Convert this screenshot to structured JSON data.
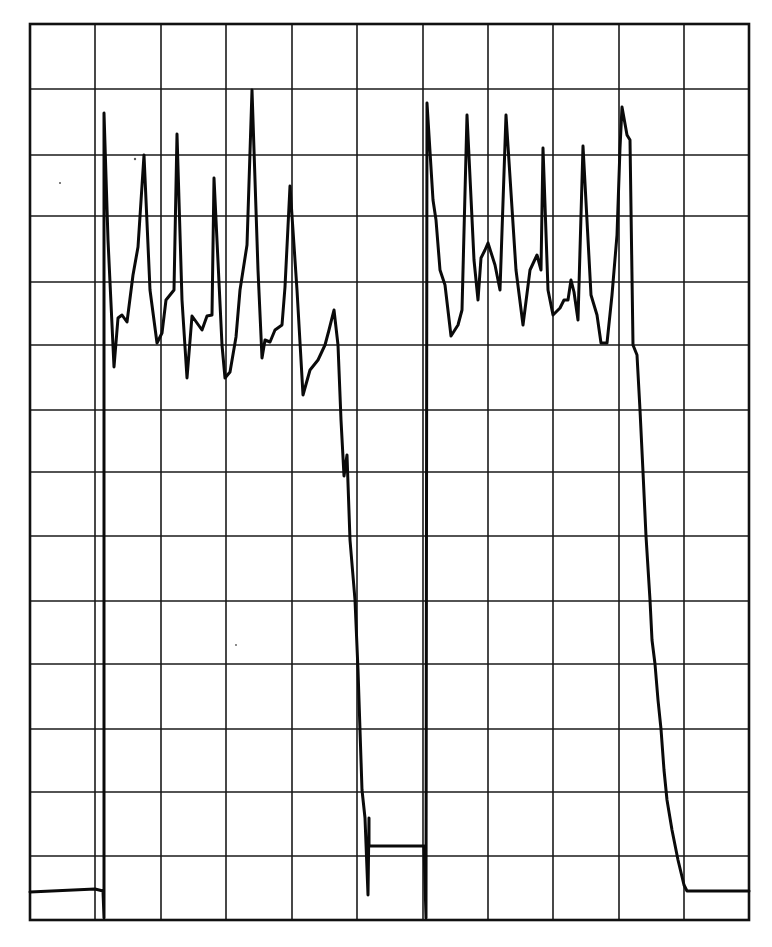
{
  "chart_data": {
    "type": "line",
    "title": "",
    "xlabel": "",
    "ylabel": "",
    "grid": true,
    "legend": null,
    "x_divisions": 11,
    "y_divisions": 14,
    "xlim": [
      0,
      11
    ],
    "ylim": [
      0,
      14
    ],
    "series": [
      {
        "name": "trace",
        "x": [
          0.0,
          1.0,
          1.13,
          1.15,
          1.2,
          1.33,
          1.41,
          1.49,
          1.63,
          1.72,
          1.83,
          1.92,
          2.05,
          2.18,
          2.24,
          2.4,
          2.49,
          2.56,
          2.64,
          2.72,
          2.8,
          2.81,
          2.93,
          2.97,
          3.05,
          3.2,
          3.32,
          3.39,
          3.55,
          3.59,
          3.67,
          3.75,
          3.85,
          3.9,
          3.97,
          4.08,
          4.17,
          4.28,
          4.39,
          4.52,
          4.59,
          4.64,
          4.69,
          4.74,
          4.81,
          4.88,
          4.94,
          5.02,
          5.06,
          5.15,
          5.18,
          5.5,
          5.54,
          5.57,
          5.64,
          5.72,
          5.79,
          5.88,
          5.99,
          6.06,
          6.11,
          6.18,
          6.24,
          6.3,
          6.38,
          6.45,
          6.53,
          6.6,
          6.69,
          6.79,
          6.9,
          6.97,
          7.04,
          7.13,
          7.2,
          7.2,
          7.28,
          7.36,
          7.46,
          7.52,
          7.58,
          7.62,
          7.67,
          7.72,
          7.79,
          7.91,
          8.0,
          8.06,
          8.15,
          8.23,
          8.3,
          8.34,
          8.37,
          8.45,
          8.49,
          8.54,
          8.58,
          8.62,
          8.67,
          8.72,
          8.81,
          8.9,
          8.99,
          9.04,
          9.13,
          9.24,
          9.42,
          9.52,
          11.0
        ],
        "y": [
          0.42,
          0.48,
          0.04,
          12.58,
          8.64,
          9.2,
          10.34,
          11.95,
          9.03,
          9.86,
          12.28,
          8.48,
          9.39,
          9.3,
          9.4,
          9.41,
          11.59,
          9.08,
          8.48,
          8.58,
          9.86,
          10.55,
          12.97,
          8.88,
          9.17,
          9.14,
          9.33,
          9.41,
          10.0,
          11.63,
          10.0,
          8.39,
          8.78,
          8.94,
          9.17,
          9.58,
          9.06,
          7.88,
          6.95,
          7.27,
          5.94,
          4.33,
          3.39,
          2.17,
          1.36,
          0.39,
          1.13,
          1.13,
          1.13,
          0.03,
          1.13,
          12.77,
          10.94,
          10.16,
          9.92,
          9.13,
          9.3,
          9.53,
          12.58,
          10.31,
          9.69,
          10.34,
          10.58,
          10.23,
          9.84,
          12.58,
          10.31,
          9.3,
          10.16,
          10.39,
          10.0,
          12.05,
          10.16,
          9.45,
          9.56,
          9.69,
          10.0,
          9.81,
          9.38,
          12.08,
          9.77,
          9.45,
          9.02,
          9.02,
          9.77,
          10.7,
          12.08,
          12.72,
          12.28,
          12.2,
          8.98,
          8.86,
          7.97,
          7.0,
          6.02,
          5.0,
          4.38,
          3.97,
          2.98,
          1.98,
          1.56,
          1.09,
          0.63,
          0.47,
          0.45,
          0.45,
          0.45,
          0.45,
          0.45
        ]
      }
    ],
    "annotations": []
  },
  "graticule": {
    "frame": {
      "x0": 30,
      "y0": 24,
      "x1": 749,
      "y1": 920
    },
    "vertical_lines_x": [
      95,
      161,
      226,
      292,
      357,
      423,
      488,
      553,
      619,
      684
    ],
    "horizontal_lines_y": [
      89,
      155,
      216,
      282,
      345,
      410,
      472,
      536,
      601,
      664,
      729,
      792,
      856
    ]
  },
  "trace_path": "M30,892 L95,889 L103,891 L104,918 L104,113 L108,240 L114,367 L118,318 L122,315 L127,322 L133,275 L138,247 L144,155 L150,290 L157,343 L162,333 L166,300 L174,290 L177,134 L182,300 L187,378 L192,316 L197,323 L202,330 L207,316 L212,315 L214,178 L222,345 L225,378 L230,372 L236,337 L240,290 L247,245 L252,90 L258,270 L262,358 L265,340 L270,342 L275,330 L282,325 L285,287 L290,186 L297,290 L303,395 L310,370 L318,360 L325,345 L329,330 L334,310 L338,345 L341,420 L344,476 L347,455 L350,540 L355,600 L358,670 L362,790 L365,818 L368,895 L369,818 L369,846 L424,846 L426,918 L427,103 L433,200 L436,220 L440,270 L445,285 L451,336 L458,325 L462,310 L467,115 L474,260 L478,300 L481,258 L485,250 L488,243 L495,265 L500,290 L506,115 L516,270 L523,325 L530,270 L537,255 L541,270 L543,148 L548,290 L553,315 L560,308 L564,300 L568,300 L571,280 L574,292 L578,320 L583,146 L591,295 L597,315 L601,343 L607,343 L612,295 L617,235 L620,148 L622,107 L627,135 L630,140 L633,345 L637,355 L640,410 L643,472 L646,536 L650,600 L652,640 L655,664 L658,700 L661,729 L664,770 L667,800 L672,830 L678,860 L684,885 L687,891 L749,891"
}
